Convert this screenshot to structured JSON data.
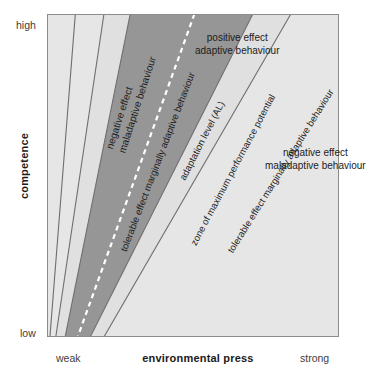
{
  "figure": {
    "colors": {
      "background": "#ffffff",
      "plot_light": "#e6e6e6",
      "band_light": "#e0e0e0",
      "zone_dark": "#969696",
      "line": "#6e6e6e",
      "frame": "#8c8c8c",
      "dashed_line": "#ffffff",
      "text": "#1c1c1c"
    }
  },
  "axes": {
    "y": {
      "title": "competence",
      "high_label": "high",
      "low_label": "low"
    },
    "x": {
      "title": "environmental press",
      "weak_label": "weak",
      "strong_label": "strong"
    }
  },
  "regions": {
    "negative_left": {
      "line1": "negative effect",
      "line2": "maladaptive behaviour"
    },
    "tolerable_left": {
      "label": "tolerable effect marginally adaptive behaviour"
    },
    "adaptation_level": {
      "label": "adaptation level (AL)"
    },
    "zone_maximum": {
      "label": "zone of maximum performance potential"
    },
    "positive": {
      "line1": "positive effect",
      "line2": "adaptive behaviour"
    },
    "tolerable_right": {
      "label": "tolerable effect marginally adaptive behaviour"
    },
    "negative_right": {
      "line1": "negative effect",
      "line2": "maladaptive behaviour"
    }
  },
  "chart_data": {
    "type": "area",
    "xlabel": "environmental press",
    "ylabel": "competence",
    "xlim": [
      "weak",
      "strong"
    ],
    "ylim": [
      "low",
      "high"
    ],
    "grid": false,
    "legend_position": "none",
    "origin_note": "all boundary rays fan out from a common apex near the lower-left corner",
    "apex": {
      "x": 0.045,
      "y": 0.0
    },
    "boundaries": [
      {
        "name": "outer-left boundary of negative/maladaptive zone",
        "top_x": 0.097,
        "bottom_x": 0.01,
        "style": "solid"
      },
      {
        "name": "left boundary of tolerable marginally adaptive band",
        "top_x": 0.195,
        "bottom_x": 0.03,
        "style": "solid"
      },
      {
        "name": "left boundary of zone of maximum performance potential",
        "top_x": 0.285,
        "bottom_x": 0.062,
        "style": "solid"
      },
      {
        "name": "adaptation level (AL)",
        "top_x": 0.505,
        "bottom_x": 0.105,
        "style": "dashed"
      },
      {
        "name": "right boundary of zone of maximum performance potential",
        "top_x": 0.705,
        "bottom_x": 0.148,
        "style": "solid"
      },
      {
        "name": "right boundary of tolerable marginally adaptive band",
        "top_x": 0.835,
        "bottom_x": 0.195,
        "style": "solid"
      }
    ],
    "bands": [
      {
        "name": "negative effect maladaptive behaviour (left)",
        "fill": "#e6e6e6",
        "order": 1
      },
      {
        "name": "tolerable effect marginally adaptive behaviour (left)",
        "fill": "#e0e0e0",
        "order": 2
      },
      {
        "name": "zone of maximum performance potential",
        "fill": "#969696",
        "order": 3
      },
      {
        "name": "tolerable effect marginally adaptive behaviour (right)",
        "fill": "#e0e0e0",
        "order": 4
      },
      {
        "name": "negative effect maladaptive behaviour (right)",
        "fill": "#e6e6e6",
        "order": 5
      }
    ]
  }
}
